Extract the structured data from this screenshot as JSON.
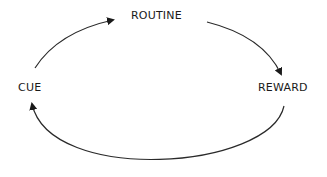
{
  "diagram": {
    "type": "cycle",
    "nodes": [
      {
        "id": "routine",
        "label": "ROUTINE"
      },
      {
        "id": "cue",
        "label": "CUE"
      },
      {
        "id": "reward",
        "label": "REWARD"
      }
    ],
    "edges": [
      {
        "from": "cue",
        "to": "routine"
      },
      {
        "from": "routine",
        "to": "reward"
      },
      {
        "from": "reward",
        "to": "cue"
      }
    ],
    "colors": {
      "stroke": "#2a2a2a",
      "text": "#1a1a1a",
      "background": "#ffffff"
    }
  }
}
